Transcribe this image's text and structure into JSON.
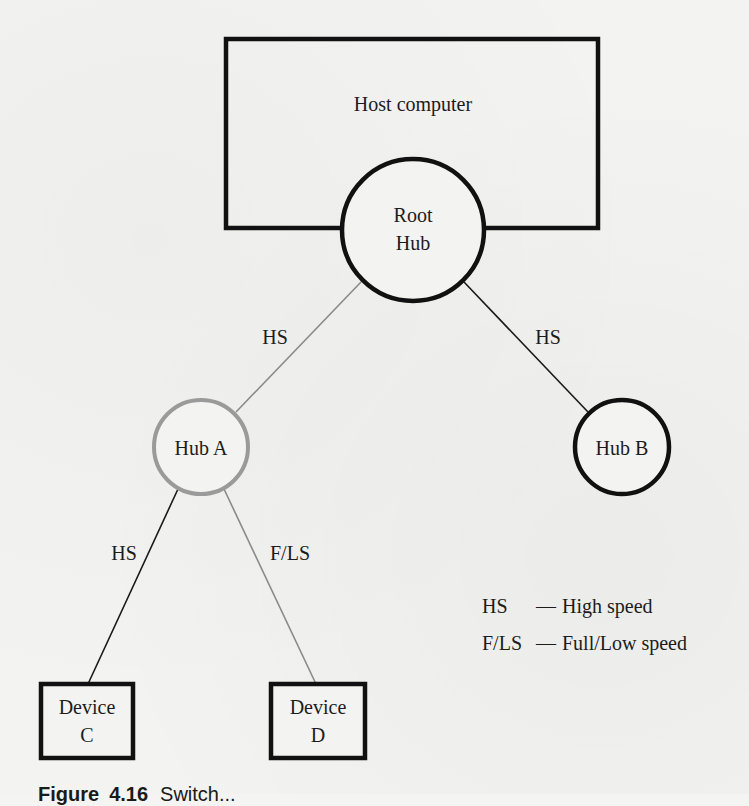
{
  "diagram": {
    "host": {
      "label": "Host computer"
    },
    "root_hub": {
      "line1": "Root",
      "line2": "Hub"
    },
    "hubs": [
      {
        "id": "hub-a",
        "label": "Hub A",
        "stroke": "#9a9a9a"
      },
      {
        "id": "hub-b",
        "label": "Hub B",
        "stroke": "#111111"
      }
    ],
    "devices": [
      {
        "id": "device-c",
        "line1": "Device",
        "line2": "C"
      },
      {
        "id": "device-d",
        "line1": "Device",
        "line2": "D"
      }
    ],
    "links": [
      {
        "from": "Root Hub",
        "to": "Hub A",
        "label": "HS",
        "stroke": "#8a8a8a"
      },
      {
        "from": "Root Hub",
        "to": "Hub B",
        "label": "HS",
        "stroke": "#1a1a1a"
      },
      {
        "from": "Hub A",
        "to": "Device C",
        "label": "HS",
        "stroke": "#1a1a1a"
      },
      {
        "from": "Hub A",
        "to": "Device D",
        "label": "F/LS",
        "stroke": "#8a8a8a"
      }
    ],
    "legend": [
      {
        "key": "HS",
        "dash": "—",
        "desc": "High speed"
      },
      {
        "key": "F/LS",
        "dash": "—",
        "desc": "Full/Low speed"
      }
    ]
  },
  "caption": {
    "prefix": "Figure",
    "number": "4.16",
    "title": "Switch..."
  }
}
